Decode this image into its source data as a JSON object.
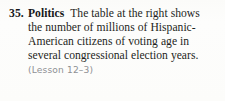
{
  "exercise": {
    "number": "35.",
    "label": "Politics",
    "text": "The table at the right shows the number of millions of Hispanic-American citizens of voting age in several congressional election years.",
    "lesson_reference": "(Lesson 12–3)",
    "colors": {
      "page_background": "#fdfdfb",
      "body_text": "#1d1f22",
      "heading_text": "#17181a",
      "lesson_text": "#8e9094"
    }
  }
}
